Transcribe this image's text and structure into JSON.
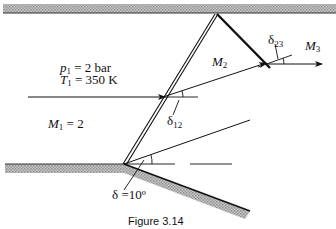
{
  "figure": {
    "caption": "Figure 3.14",
    "labels": {
      "p1_sym": "p",
      "p1_sub": "1",
      "p1_val": " = 2 bar",
      "T1_sym": "T",
      "T1_sub": "1",
      "T1_val": " = 350 K",
      "M1_sym": "M",
      "M1_sub": "1",
      "M1_val": " = 2",
      "M2_sym": "M",
      "M2_sub": "2",
      "M3_sym": "M",
      "M3_sub": "3",
      "delta12_sym": "δ",
      "delta12_sub": "12",
      "delta23_sym": "δ",
      "delta23_sub": "23",
      "delta_wall": "δ =10º"
    },
    "colors": {
      "line": "#111111",
      "wall_hatch": "#a8a8a8"
    }
  }
}
